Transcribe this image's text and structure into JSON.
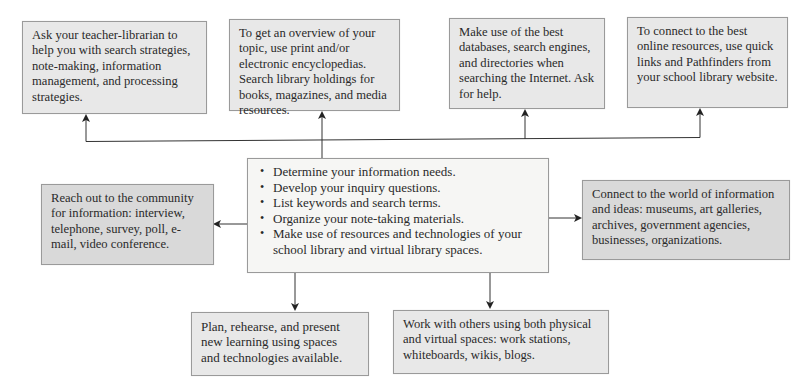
{
  "diagram": {
    "type": "hub-and-spoke flow diagram",
    "colors": {
      "box_fill": "#e8e8e8",
      "box_fill_dark": "#d9d9d9",
      "center_fill": "#f6f6f4",
      "border": "#9a9a9a",
      "line": "#333333",
      "text": "#2a2a2a"
    },
    "center": {
      "items": [
        "Determine your information needs.",
        "Develop your inquiry questions.",
        "List keywords and search terms.",
        "Organize your note-taking materials.",
        "Make use of resources and technologies of your school library and virtual library spaces."
      ]
    },
    "top_boxes": [
      {
        "text": "Ask your teacher-librarian to help you with search strategies, note-making, information management, and processing strategies."
      },
      {
        "text": "To get an overview of your topic, use print and/or electronic encyclopedias. Search library holdings for books, magazines, and media resources."
      },
      {
        "text": "Make use of the best databases, search engines, and directories when searching the Internet. Ask for help."
      },
      {
        "text": "To connect to the best online resources, use quick links and Pathfinders from your school library website."
      }
    ],
    "left_box": {
      "text": "Reach out to the community for information: interview, telephone, survey, poll, e-mail, video conference."
    },
    "right_box": {
      "text": "Connect to the world of information and ideas: museums, art galleries, archives, government agencies, businesses, organizations."
    },
    "bottom_boxes": [
      {
        "text": "Plan, rehearse, and present new learning using spaces and technologies available."
      },
      {
        "text": "Work with others using both physical and virtual spaces: work stations, whiteboards, wikis, blogs."
      }
    ],
    "connections": [
      {
        "from": "center",
        "to": "top_boxes.0",
        "arrow": "up"
      },
      {
        "from": "center",
        "to": "top_boxes.1",
        "arrow": "up"
      },
      {
        "from": "center",
        "to": "top_boxes.2",
        "arrow": "up"
      },
      {
        "from": "center",
        "to": "top_boxes.3",
        "arrow": "up"
      },
      {
        "from": "center",
        "to": "left_box",
        "arrow": "left"
      },
      {
        "from": "center",
        "to": "right_box",
        "arrow": "right"
      },
      {
        "from": "center",
        "to": "bottom_boxes.0",
        "arrow": "down"
      },
      {
        "from": "center",
        "to": "bottom_boxes.1",
        "arrow": "down"
      }
    ]
  }
}
